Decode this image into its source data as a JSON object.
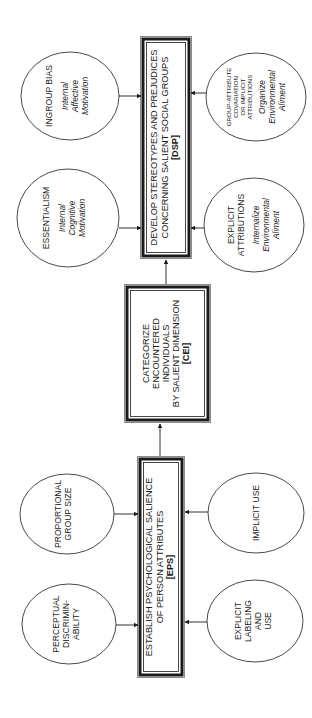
{
  "diagram": {
    "orientation": "rotated-90-ccw",
    "colors": {
      "background": "#ffffff",
      "stroke": "#1a1a1a",
      "border_outer": "#8a8a8a"
    },
    "boxes": {
      "dsp": {
        "lines": [
          "DEVELOP STEREOTYPES AND PREJUDICES",
          "CONCERNING SALIENT SOCIAL GROUPS"
        ],
        "code": "[DSP]"
      },
      "cei": {
        "lines": [
          "CATEGORIZE",
          "ENCOUNTERED",
          "INDIVIDUALS",
          "BY SALIENT DIMENSION"
        ],
        "code": "[CEI]"
      },
      "eps": {
        "lines": [
          "ESTABLISH PSYCHOLOGICAL SALIENCE",
          "OF PERSON ATTRIBUTES"
        ],
        "code": "[EPS]"
      }
    },
    "ellipses": {
      "ingroup_bias": {
        "lines": [
          "INGROUP BIAS"
        ],
        "sub": [
          "Internal",
          "Affective",
          "Motivation"
        ]
      },
      "essentialism": {
        "lines": [
          "ESSENTIALISM"
        ],
        "sub": [
          "Internal",
          "Cognitive",
          "Motivation"
        ]
      },
      "group_attribute": {
        "lines": [
          "GROUP-ATTRIBUTE",
          "COVARIATION",
          "OR IMPLICIT",
          "ATTRIBUTIONS"
        ],
        "sub": [
          "Organize",
          "Environmental",
          "Aliment"
        ]
      },
      "explicit_attributions": {
        "lines": [
          "EXPLICIT",
          "ATTRIBUTIONS"
        ],
        "sub": [
          "Internalize",
          "Environmental",
          "Aliment"
        ]
      },
      "proportional_group_size": {
        "lines": [
          "PROPORTIONAL",
          "GROUP SIZE"
        ]
      },
      "perceptual_discriminability": {
        "lines": [
          "PERCEPTUAL",
          "DISCRIMIN-",
          "ABILITY"
        ]
      },
      "implicit_use": {
        "lines": [
          "IMPLICIT USE"
        ]
      },
      "explicit_labeling": {
        "lines": [
          "EXPLICIT",
          "LABELING",
          "AND",
          "USE"
        ]
      }
    }
  }
}
